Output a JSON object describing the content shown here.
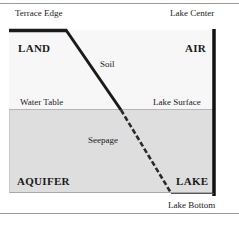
{
  "diagram": {
    "top_labels": {
      "left": "Terrace Edge",
      "right": "Lake Center"
    },
    "bottom_label": "Lake Bottom",
    "zones": {
      "land": "LAND",
      "air": "AIR",
      "aquifer": "AQUIFER",
      "lake": "LAKE"
    },
    "annotations": {
      "soil": "Soil",
      "water_table": "Water Table",
      "lake_surface": "Lake Surface",
      "seepage": "Seepage"
    },
    "colors": {
      "upper_zone": "#f7f7f7",
      "lower_zone": "#dedede",
      "lines": "#1a1a1a",
      "rules": "#9a9a9a"
    }
  }
}
